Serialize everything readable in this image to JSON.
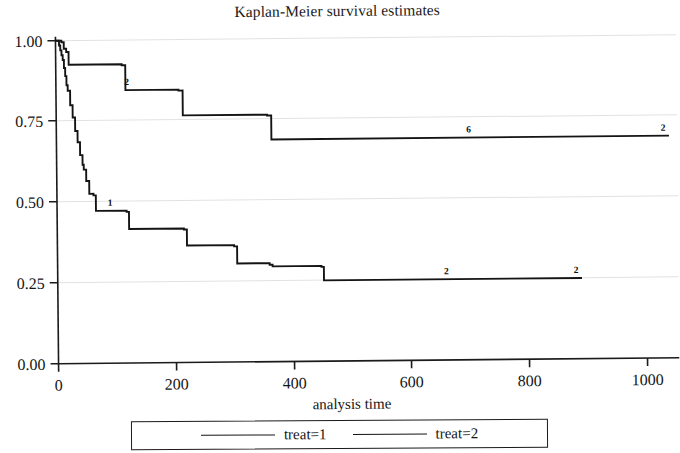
{
  "chart_data": {
    "type": "line",
    "subtype": "kaplan-meier-step",
    "title": "Kaplan-Meier survival estimates",
    "xlabel": "analysis time",
    "ylabel": "",
    "xlim": [
      0,
      1060
    ],
    "ylim": [
      0.0,
      1.0
    ],
    "xticks": [
      0,
      200,
      400,
      600,
      800,
      1000
    ],
    "xtick_labels": [
      "0",
      "200",
      "400",
      "600",
      "800",
      "1000"
    ],
    "yticks": [
      0.0,
      0.25,
      0.5,
      0.75,
      1.0
    ],
    "ytick_labels": [
      "0.00",
      "0.25",
      "0.50",
      "0.75",
      "1.00"
    ],
    "grid": "horizontal",
    "legend_position": "below-axes",
    "series": [
      {
        "name": "treat=1",
        "label": "treat=1",
        "color": "#141414",
        "steps": [
          [
            0,
            1.0
          ],
          [
            6,
            0.985
          ],
          [
            8,
            0.97
          ],
          [
            10,
            0.955
          ],
          [
            12,
            0.94
          ],
          [
            14,
            0.915
          ],
          [
            16,
            0.89
          ],
          [
            18,
            0.862
          ],
          [
            20,
            0.845
          ],
          [
            24,
            0.8
          ],
          [
            28,
            0.762
          ],
          [
            32,
            0.72
          ],
          [
            36,
            0.685
          ],
          [
            40,
            0.645
          ],
          [
            44,
            0.615
          ],
          [
            46,
            0.6
          ],
          [
            50,
            0.565
          ],
          [
            55,
            0.525
          ],
          [
            62,
            0.52
          ],
          [
            66,
            0.472
          ],
          [
            118,
            0.468
          ],
          [
            122,
            0.415
          ],
          [
            215,
            0.412
          ],
          [
            220,
            0.362
          ],
          [
            300,
            0.358
          ],
          [
            305,
            0.305
          ],
          [
            360,
            0.3
          ],
          [
            365,
            0.295
          ],
          [
            448,
            0.292
          ],
          [
            452,
            0.25
          ],
          [
            890,
            0.25
          ]
        ],
        "censor_marks": [
          {
            "time": 90,
            "count": "1"
          },
          {
            "time": 660,
            "count": "2"
          },
          {
            "time": 880,
            "count": "2"
          }
        ]
      },
      {
        "name": "treat=2",
        "label": "treat=2",
        "color": "#141414",
        "steps": [
          [
            0,
            1.0
          ],
          [
            10,
            0.995
          ],
          [
            14,
            0.975
          ],
          [
            18,
            0.965
          ],
          [
            22,
            0.925
          ],
          [
            112,
            0.922
          ],
          [
            118,
            0.845
          ],
          [
            208,
            0.842
          ],
          [
            215,
            0.765
          ],
          [
            358,
            0.762
          ],
          [
            365,
            0.688
          ],
          [
            1040,
            0.688
          ]
        ],
        "censor_marks": [
          {
            "time": 120,
            "count": "2"
          },
          {
            "time": 700,
            "count": "6"
          },
          {
            "time": 1030,
            "count": "2"
          }
        ]
      }
    ]
  },
  "legend": {
    "entries": [
      {
        "label": "treat=1"
      },
      {
        "label": "treat=2"
      }
    ]
  }
}
